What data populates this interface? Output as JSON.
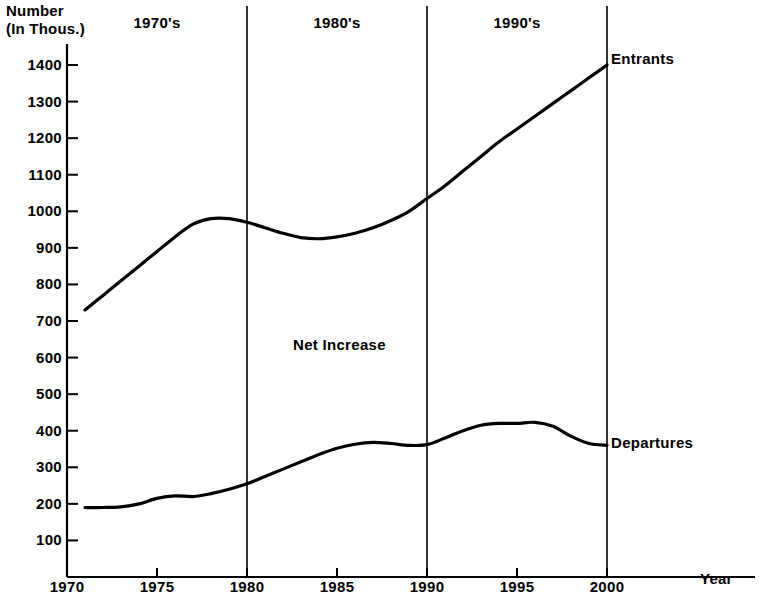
{
  "chart_data": {
    "type": "line",
    "title": "",
    "ylabel": "Number (In Thous.)",
    "ylabel_line1": "Number",
    "ylabel_line2": "(In Thous.)",
    "xlabel": "Year",
    "xlim": [
      1970,
      2002
    ],
    "ylim": [
      0,
      1450
    ],
    "grid": false,
    "y_ticks": [
      1400,
      1300,
      1200,
      1100,
      1000,
      900,
      800,
      700,
      600,
      500,
      400,
      300,
      200,
      100
    ],
    "x_ticks": [
      1970,
      1975,
      1980,
      1985,
      1990,
      1995,
      2000
    ],
    "legend_position": "right-inline",
    "annotations": [
      {
        "text": "Net Increase",
        "x": 1984,
        "y": 590
      },
      {
        "text": "1970's",
        "x": 1975,
        "y": 1440
      },
      {
        "text": "1980's",
        "x": 1985,
        "y": 1440
      },
      {
        "text": "1990's",
        "x": 1995,
        "y": 1440
      }
    ],
    "decade_labels": [
      "1970's",
      "1980's",
      "1990's"
    ],
    "decade_dividers": [
      1980,
      1990,
      2000
    ],
    "series": [
      {
        "name": "Entrants",
        "x": [
          1971,
          1972,
          1973,
          1974,
          1975,
          1976,
          1977,
          1978,
          1979,
          1980,
          1981,
          1982,
          1983,
          1984,
          1985,
          1986,
          1987,
          1988,
          1989,
          1990,
          1991,
          1992,
          1993,
          1994,
          1995,
          1996,
          1997,
          1998,
          1999,
          2000
        ],
        "values": [
          730,
          770,
          810,
          850,
          890,
          930,
          965,
          980,
          980,
          970,
          955,
          940,
          928,
          925,
          930,
          940,
          955,
          975,
          1000,
          1035,
          1070,
          1110,
          1150,
          1190,
          1225,
          1260,
          1295,
          1330,
          1365,
          1400
        ]
      },
      {
        "name": "Departures",
        "x": [
          1971,
          1972,
          1973,
          1974,
          1975,
          1976,
          1977,
          1978,
          1979,
          1980,
          1981,
          1982,
          1983,
          1984,
          1985,
          1986,
          1987,
          1988,
          1989,
          1990,
          1991,
          1992,
          1993,
          1994,
          1995,
          1996,
          1997,
          1998,
          1999,
          2000
        ],
        "values": [
          190,
          190,
          192,
          200,
          215,
          222,
          220,
          228,
          240,
          255,
          275,
          295,
          315,
          335,
          352,
          363,
          368,
          365,
          360,
          362,
          380,
          400,
          415,
          420,
          420,
          423,
          412,
          385,
          365,
          360
        ]
      }
    ]
  },
  "labels": {
    "entrants": "Entrants",
    "departures": "Departures",
    "net_increase": "Net Increase",
    "year": "Year",
    "number_line1": "Number",
    "number_line2": "(In Thous.)"
  },
  "colors": {
    "line": "#000000",
    "background": "#ffffff",
    "axis": "#000000"
  }
}
